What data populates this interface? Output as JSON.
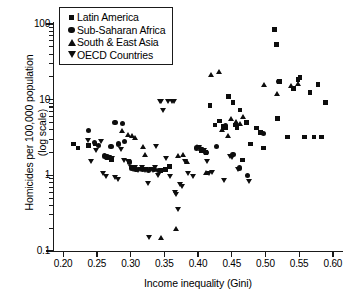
{
  "chart_data": {
    "type": "scatter",
    "title": "",
    "xlabel": "Income inequality (Gini)",
    "ylabel": "Homicides per 100,000 population (log scale)",
    "yscale": "log",
    "xlim": [
      0.185,
      0.615
    ],
    "ylim": [
      0.1,
      100
    ],
    "grid": false,
    "legend_position": "top-left",
    "xticks": [
      "0.20",
      "0.25",
      "0.30",
      "0.35",
      "0.40",
      "0.45",
      "0.50",
      "0.55",
      "0.60"
    ],
    "xtick_values": [
      0.2,
      0.25,
      0.3,
      0.35,
      0.4,
      0.45,
      0.5,
      0.55,
      0.6
    ],
    "yticks": [
      "100",
      "10",
      "1",
      "0.1"
    ],
    "ytick_values": [
      100,
      10,
      1,
      0.1
    ],
    "series": [
      {
        "name": "Latin America",
        "marker": "square",
        "points": [
          [
            0.215,
            2.6
          ],
          [
            0.222,
            2.3
          ],
          [
            0.238,
            2.5
          ],
          [
            0.247,
            2.6
          ],
          [
            0.262,
            1.8
          ],
          [
            0.265,
            1.75
          ],
          [
            0.272,
            1.6
          ],
          [
            0.345,
            1.15
          ],
          [
            0.352,
            1.2
          ],
          [
            0.358,
            1.3
          ],
          [
            0.405,
            2.1
          ],
          [
            0.412,
            2.0
          ],
          [
            0.418,
            8.3
          ],
          [
            0.425,
            4.6
          ],
          [
            0.432,
            5.2
          ],
          [
            0.437,
            4.4
          ],
          [
            0.441,
            4.3
          ],
          [
            0.445,
            11.0
          ],
          [
            0.452,
            9.1
          ],
          [
            0.456,
            4.6
          ],
          [
            0.458,
            4.3
          ],
          [
            0.462,
            7.3
          ],
          [
            0.466,
            1.6
          ],
          [
            0.472,
            5.0
          ],
          [
            0.478,
            2.6
          ],
          [
            0.487,
            4.2
          ],
          [
            0.493,
            3.7
          ],
          [
            0.497,
            2.3
          ],
          [
            0.513,
            85.0
          ],
          [
            0.516,
            54.0
          ],
          [
            0.518,
            5.6
          ],
          [
            0.521,
            17.5
          ],
          [
            0.533,
            3.2
          ],
          [
            0.542,
            14.0
          ],
          [
            0.548,
            18.5
          ],
          [
            0.551,
            19.5
          ],
          [
            0.558,
            3.2
          ],
          [
            0.566,
            12.5
          ],
          [
            0.572,
            3.2
          ],
          [
            0.578,
            16.0
          ],
          [
            0.583,
            3.2
          ],
          [
            0.589,
            9.2
          ]
        ]
      },
      {
        "name": "Sub-Saharan Africa",
        "marker": "circle",
        "points": [
          [
            0.238,
            3.9
          ],
          [
            0.247,
            2.7
          ],
          [
            0.252,
            2.5
          ],
          [
            0.261,
            1.8
          ],
          [
            0.265,
            1.75
          ],
          [
            0.271,
            2.4
          ],
          [
            0.277,
            5.0
          ],
          [
            0.282,
            2.6
          ],
          [
            0.288,
            4.9
          ],
          [
            0.291,
            2.8
          ],
          [
            0.298,
            1.5
          ],
          [
            0.302,
            1.25
          ],
          [
            0.308,
            1.2
          ],
          [
            0.318,
            1.2
          ],
          [
            0.327,
            1.15
          ],
          [
            0.336,
            1.2
          ],
          [
            0.342,
            1.15
          ],
          [
            0.398,
            2.3
          ],
          [
            0.412,
            2.0
          ],
          [
            0.428,
            2.4
          ],
          [
            0.441,
            4.6
          ],
          [
            0.452,
            1.9
          ],
          [
            0.461,
            1.25
          ],
          [
            0.474,
            1.0
          ],
          [
            0.497,
            3.6
          ],
          [
            0.519,
            17.5
          ]
        ]
      },
      {
        "name": "South & East Asia",
        "marker": "triangle-up",
        "points": [
          [
            0.288,
            3.9
          ],
          [
            0.296,
            3.5
          ],
          [
            0.302,
            3.4
          ],
          [
            0.306,
            3.2
          ],
          [
            0.318,
            2.4
          ],
          [
            0.322,
            1.9
          ],
          [
            0.345,
            0.15
          ],
          [
            0.367,
            0.2
          ],
          [
            0.371,
            1.8
          ],
          [
            0.378,
            1.9
          ],
          [
            0.383,
            1.5
          ],
          [
            0.398,
            2.4
          ],
          [
            0.404,
            2.25
          ],
          [
            0.412,
            1.1
          ],
          [
            0.419,
            21.5
          ],
          [
            0.431,
            23.5
          ],
          [
            0.436,
            4.0
          ],
          [
            0.444,
            3.4
          ],
          [
            0.449,
            5.6
          ],
          [
            0.456,
            5.2
          ],
          [
            0.462,
            4.9
          ],
          [
            0.466,
            6.0
          ],
          [
            0.498,
            16.0
          ],
          [
            0.517,
            12.0
          ],
          [
            0.538,
            15.5
          ],
          [
            0.549,
            16.5
          ]
        ]
      },
      {
        "name": "OECD Countries",
        "marker": "triangle-down",
        "points": [
          [
            0.237,
            2.9
          ],
          [
            0.241,
            1.5
          ],
          [
            0.249,
            2.1
          ],
          [
            0.256,
            2.8
          ],
          [
            0.259,
            1.05
          ],
          [
            0.263,
            0.95
          ],
          [
            0.268,
            1.7
          ],
          [
            0.272,
            1.65
          ],
          [
            0.277,
            0.92
          ],
          [
            0.281,
            0.88
          ],
          [
            0.286,
            2.2
          ],
          [
            0.291,
            1.55
          ],
          [
            0.296,
            1.5
          ],
          [
            0.301,
            1.25
          ],
          [
            0.304,
            1.2
          ],
          [
            0.307,
            1.25
          ],
          [
            0.311,
            1.15
          ],
          [
            0.314,
            1.2
          ],
          [
            0.317,
            1.25
          ],
          [
            0.319,
            1.2
          ],
          [
            0.321,
            1.15
          ],
          [
            0.323,
            1.2
          ],
          [
            0.326,
            0.78
          ],
          [
            0.327,
            0.15
          ],
          [
            0.331,
            1.2
          ],
          [
            0.334,
            1.15
          ],
          [
            0.336,
            1.25
          ],
          [
            0.338,
            2.4
          ],
          [
            0.341,
            1.0
          ],
          [
            0.344,
            9.4
          ],
          [
            0.346,
            9.3
          ],
          [
            0.348,
            7.2
          ],
          [
            0.352,
            1.65
          ],
          [
            0.355,
            9.3
          ],
          [
            0.358,
            0.96
          ],
          [
            0.362,
            9.4
          ],
          [
            0.364,
            9.3
          ],
          [
            0.366,
            0.6
          ],
          [
            0.368,
            0.55
          ],
          [
            0.371,
            0.35
          ],
          [
            0.373,
            0.75
          ],
          [
            0.376,
            0.72
          ],
          [
            0.381,
            1.5
          ],
          [
            0.386,
            1.05
          ],
          [
            0.392,
            0.95
          ],
          [
            0.401,
            2.3
          ],
          [
            0.405,
            2.2
          ],
          [
            0.409,
            2.15
          ],
          [
            0.413,
            1.5
          ],
          [
            0.417,
            1.05
          ],
          [
            0.421,
            1.1
          ],
          [
            0.438,
            0.85
          ],
          [
            0.447,
            1.75
          ],
          [
            0.451,
            1.7
          ],
          [
            0.459,
            1.2
          ],
          [
            0.476,
            0.82
          ]
        ]
      }
    ]
  },
  "legend": {
    "items": [
      {
        "label": "Latin America",
        "marker": "square"
      },
      {
        "label": "Sub-Saharan Africa",
        "marker": "circle"
      },
      {
        "label": "South & East Asia",
        "marker": "triangle-up"
      },
      {
        "label": "OECD Countries",
        "marker": "triangle-down"
      }
    ]
  },
  "axes": {
    "x_title": "Income inequality (Gini)",
    "y_title_line1": "Homicides per 100,000 population",
    "y_title_line2": "(log scale)"
  }
}
